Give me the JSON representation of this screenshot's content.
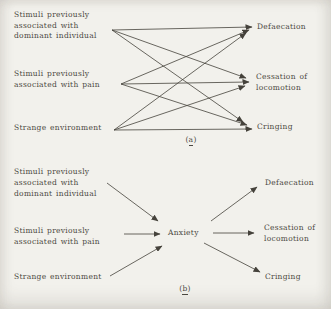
{
  "figure": {
    "colors": {
      "paper": "#f2f1ec",
      "ink": "#4c4942"
    },
    "panel_a": {
      "caption": {
        "open": "(",
        "letter": "a",
        "close": ")"
      },
      "stimuli": [
        {
          "id": "s0",
          "lines": [
            "Stimuli previously",
            "associated with",
            "dominant individual"
          ]
        },
        {
          "id": "s1",
          "lines": [
            "Stimuli previously",
            "associated with pain"
          ]
        },
        {
          "id": "s2",
          "lines": [
            "Strange environment"
          ]
        }
      ],
      "responses": [
        {
          "id": "r0",
          "lines": [
            "Defaecation"
          ]
        },
        {
          "id": "r1",
          "lines": [
            "Cessation of",
            "locomotion"
          ]
        },
        {
          "id": "r2",
          "lines": [
            "Cringing"
          ]
        }
      ],
      "edges": [
        {
          "from": "s0",
          "to": "r0"
        },
        {
          "from": "s0",
          "to": "r1"
        },
        {
          "from": "s0",
          "to": "r2"
        },
        {
          "from": "s1",
          "to": "r0"
        },
        {
          "from": "s1",
          "to": "r1"
        },
        {
          "from": "s1",
          "to": "r2"
        },
        {
          "from": "s2",
          "to": "r0"
        },
        {
          "from": "s2",
          "to": "r1"
        },
        {
          "from": "s2",
          "to": "r2"
        }
      ]
    },
    "panel_b": {
      "caption": {
        "open": "(",
        "letter": "b",
        "close": ")"
      },
      "stimuli": [
        {
          "id": "s0",
          "lines": [
            "Stimuli previously",
            "associated with",
            "dominant individual"
          ]
        },
        {
          "id": "s1",
          "lines": [
            "Stimuli previously",
            "associated with pain"
          ]
        },
        {
          "id": "s2",
          "lines": [
            "Strange environment"
          ]
        }
      ],
      "mediator": "Anxiety",
      "responses": [
        {
          "id": "r0",
          "lines": [
            "Defaecation"
          ]
        },
        {
          "id": "r1",
          "lines": [
            "Cessation of",
            "locomotion"
          ]
        },
        {
          "id": "r2",
          "lines": [
            "Cringing"
          ]
        }
      ],
      "edges": [
        {
          "from": "s0",
          "to": "anxiety"
        },
        {
          "from": "s1",
          "to": "anxiety"
        },
        {
          "from": "s2",
          "to": "anxiety"
        },
        {
          "from": "anxiety",
          "to": "r0"
        },
        {
          "from": "anxiety",
          "to": "r1"
        },
        {
          "from": "anxiety",
          "to": "r2"
        }
      ]
    }
  }
}
